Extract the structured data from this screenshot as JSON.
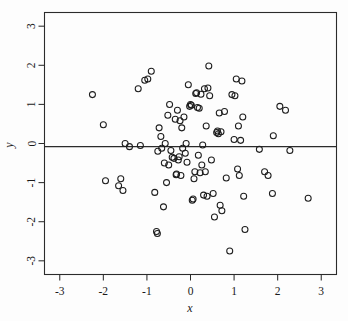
{
  "figure": {
    "background_color": "#fdfdfd",
    "frame_color": "#2b2b2b",
    "point_color": "#1d1d1d"
  },
  "chart_data": {
    "type": "scatter",
    "title": "",
    "xlabel": "x",
    "ylabel": "y",
    "xlim": [
      -3.35,
      3.35
    ],
    "ylim": [
      -3.35,
      3.35
    ],
    "grid": false,
    "legend": null,
    "marker": "open-circle",
    "marker_size": 3.0,
    "xticks": [
      -3,
      -2,
      -1,
      0,
      1,
      2,
      3
    ],
    "xticklabels": [
      "-3",
      "-2",
      "-1",
      "0",
      "1",
      "2",
      "3"
    ],
    "yticks": [
      -3,
      -2,
      -1,
      0,
      1,
      2,
      3
    ],
    "yticklabels": [
      "-3",
      "-2",
      "-1",
      "0",
      "1",
      "2",
      "3"
    ],
    "annotations": [
      {
        "type": "horizontal-line",
        "y": -0.08,
        "label": "reference-line"
      }
    ],
    "n_points": 104,
    "points": [
      [
        -2.25,
        1.25
      ],
      [
        -2.0,
        0.48
      ],
      [
        -1.95,
        -0.95
      ],
      [
        -1.65,
        -1.08
      ],
      [
        -1.6,
        -0.9
      ],
      [
        -1.55,
        -1.2
      ],
      [
        -1.5,
        0.0
      ],
      [
        -1.4,
        -0.08
      ],
      [
        -1.2,
        1.4
      ],
      [
        -1.15,
        -0.05
      ],
      [
        -1.05,
        1.62
      ],
      [
        -0.98,
        1.65
      ],
      [
        -0.9,
        1.85
      ],
      [
        -0.82,
        -1.25
      ],
      [
        -0.78,
        -2.25
      ],
      [
        -0.76,
        -2.3
      ],
      [
        -0.75,
        -0.2
      ],
      [
        -0.72,
        0.4
      ],
      [
        -0.68,
        0.18
      ],
      [
        -0.66,
        -0.12
      ],
      [
        -0.62,
        -1.62
      ],
      [
        -0.6,
        -0.5
      ],
      [
        -0.58,
        0.0
      ],
      [
        -0.55,
        -1.0
      ],
      [
        -0.52,
        0.72
      ],
      [
        -0.5,
        -0.55
      ],
      [
        -0.48,
        1.0
      ],
      [
        -0.45,
        -0.18
      ],
      [
        -0.42,
        -0.35
      ],
      [
        -0.38,
        -0.38
      ],
      [
        -0.35,
        0.62
      ],
      [
        -0.33,
        -0.8
      ],
      [
        -0.32,
        -0.78
      ],
      [
        -0.3,
        0.85
      ],
      [
        -0.28,
        -0.42
      ],
      [
        -0.26,
        -0.34
      ],
      [
        -0.24,
        0.58
      ],
      [
        -0.22,
        -0.82
      ],
      [
        -0.2,
        0.4
      ],
      [
        -0.18,
        -0.12
      ],
      [
        -0.15,
        0.68
      ],
      [
        -0.12,
        -0.25
      ],
      [
        -0.1,
        0.0
      ],
      [
        -0.08,
        -0.48
      ],
      [
        -0.05,
        1.5
      ],
      [
        -0.02,
        0.95
      ],
      [
        0.0,
        1.0
      ],
      [
        0.02,
        0.98
      ],
      [
        0.04,
        -1.45
      ],
      [
        0.06,
        -1.42
      ],
      [
        0.08,
        -0.9
      ],
      [
        0.1,
        -0.72
      ],
      [
        0.12,
        1.28
      ],
      [
        0.14,
        1.3
      ],
      [
        0.16,
        0.92
      ],
      [
        0.18,
        -0.3
      ],
      [
        0.2,
        0.9
      ],
      [
        0.22,
        -0.75
      ],
      [
        0.24,
        1.26
      ],
      [
        0.26,
        -0.55
      ],
      [
        0.28,
        -0.04
      ],
      [
        0.3,
        -1.32
      ],
      [
        0.32,
        1.4
      ],
      [
        0.34,
        -0.72
      ],
      [
        0.36,
        0.45
      ],
      [
        0.38,
        -1.35
      ],
      [
        0.4,
        1.42
      ],
      [
        0.42,
        1.98
      ],
      [
        0.44,
        1.22
      ],
      [
        0.48,
        -0.42
      ],
      [
        0.52,
        -1.28
      ],
      [
        0.55,
        -1.88
      ],
      [
        0.6,
        0.28
      ],
      [
        0.62,
        0.32
      ],
      [
        0.64,
        0.25
      ],
      [
        0.66,
        0.78
      ],
      [
        0.68,
        -1.58
      ],
      [
        0.7,
        0.3
      ],
      [
        0.72,
        -1.72
      ],
      [
        0.78,
        0.82
      ],
      [
        0.82,
        -0.88
      ],
      [
        0.9,
        -2.75
      ],
      [
        0.95,
        1.25
      ],
      [
        1.0,
        0.1
      ],
      [
        1.02,
        1.22
      ],
      [
        1.05,
        1.65
      ],
      [
        1.08,
        -0.65
      ],
      [
        1.1,
        0.45
      ],
      [
        1.12,
        -0.82
      ],
      [
        1.15,
        0.08
      ],
      [
        1.18,
        1.6
      ],
      [
        1.2,
        0.68
      ],
      [
        1.22,
        -1.35
      ],
      [
        1.25,
        -2.2
      ],
      [
        1.58,
        -0.15
      ],
      [
        1.7,
        -0.72
      ],
      [
        1.78,
        -0.82
      ],
      [
        1.88,
        -1.28
      ],
      [
        1.9,
        0.2
      ],
      [
        2.05,
        0.95
      ],
      [
        2.18,
        0.85
      ],
      [
        2.28,
        -0.18
      ],
      [
        2.7,
        -1.4
      ]
    ]
  }
}
